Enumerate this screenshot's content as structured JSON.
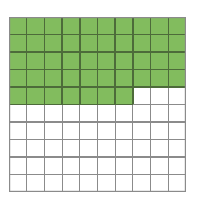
{
  "figure": {
    "description": "A 10 by 10 grid of equal square cells. The first four rows are completely shaded green and the fifth row has its first seven cells shaded green. The remaining cells are unshaded white."
  },
  "chart_data": {
    "type": "heatmap",
    "title": "",
    "subtitle": "",
    "xlabel": "",
    "ylabel": "",
    "columns": 10,
    "rows": 10,
    "total_cells": 100,
    "shaded_cells": 47,
    "unshaded_cells": 53,
    "shaded_fraction": "47/100",
    "shaded_decimal": 0.47,
    "shaded_percent": 47,
    "categories": [
      "1",
      "2",
      "3",
      "4",
      "5",
      "6",
      "7",
      "8",
      "9",
      "10"
    ],
    "row_labels": [
      "1",
      "2",
      "3",
      "4",
      "5",
      "6",
      "7",
      "8",
      "9",
      "10"
    ],
    "row_shaded_counts": [
      10,
      10,
      10,
      10,
      7,
      0,
      0,
      0,
      0,
      0
    ],
    "values": [
      [
        1,
        1,
        1,
        1,
        1,
        1,
        1,
        1,
        1,
        1
      ],
      [
        1,
        1,
        1,
        1,
        1,
        1,
        1,
        1,
        1,
        1
      ],
      [
        1,
        1,
        1,
        1,
        1,
        1,
        1,
        1,
        1,
        1
      ],
      [
        1,
        1,
        1,
        1,
        1,
        1,
        1,
        1,
        1,
        1
      ],
      [
        1,
        1,
        1,
        1,
        1,
        1,
        1,
        0,
        0,
        0
      ],
      [
        0,
        0,
        0,
        0,
        0,
        0,
        0,
        0,
        0,
        0
      ],
      [
        0,
        0,
        0,
        0,
        0,
        0,
        0,
        0,
        0,
        0
      ],
      [
        0,
        0,
        0,
        0,
        0,
        0,
        0,
        0,
        0,
        0
      ],
      [
        0,
        0,
        0,
        0,
        0,
        0,
        0,
        0,
        0,
        0
      ],
      [
        0,
        0,
        0,
        0,
        0,
        0,
        0,
        0,
        0,
        0
      ]
    ],
    "legend": [],
    "grid": true,
    "axis_visible": false
  },
  "colors": {
    "shaded_fill": "#82bc5e",
    "unshaded_fill": "#ffffff",
    "shaded_gridline": "#4d6b3a",
    "unshaded_gridline": "#8b8b8b",
    "outer_border": "#8b8b8b",
    "background": "#ffffff"
  },
  "geometry": {
    "image_width": 197,
    "image_height": 203,
    "grid_left": 9,
    "grid_top": 17,
    "grid_width": 177,
    "grid_height": 175,
    "cell_width": 17.7,
    "cell_height": 17.5
  }
}
